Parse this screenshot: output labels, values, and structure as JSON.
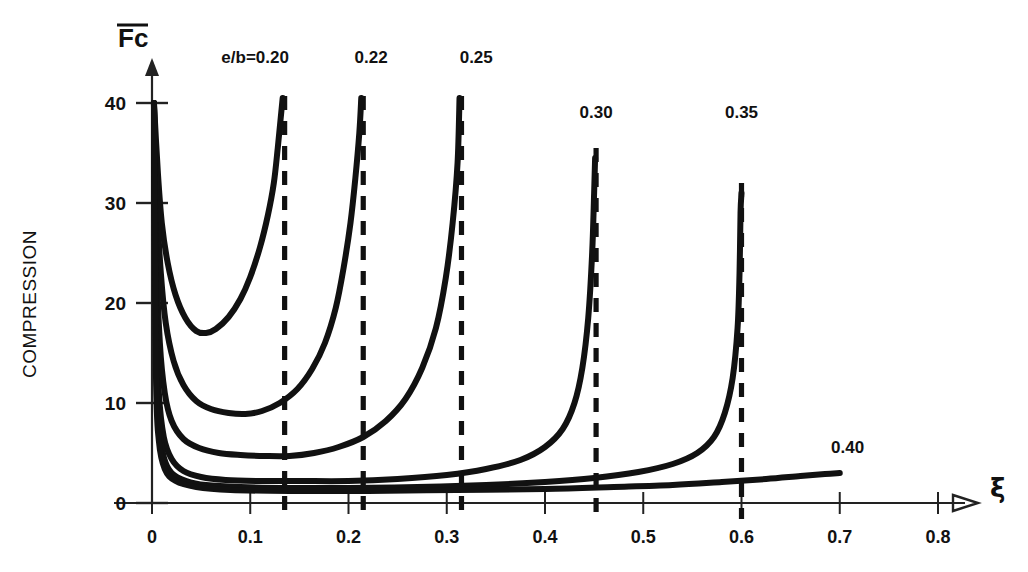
{
  "chart_data": {
    "type": "line",
    "title": "",
    "xlabel": "ξ",
    "ylabel": "Fc",
    "ylabel_full": "COMPRESSION",
    "ylabel_axis_symbol": "F̄c",
    "xlim": [
      0,
      0.8
    ],
    "ylim": [
      0,
      42
    ],
    "xticks": [
      0,
      0.1,
      0.2,
      0.3,
      0.4,
      0.5,
      0.6,
      0.7,
      0.8
    ],
    "xticklabels": [
      "0",
      "0.1",
      "0.2",
      "0.3",
      "0.4",
      "0.5",
      "0.6",
      "0.7",
      "0.8"
    ],
    "yticks": [
      0,
      10,
      20,
      30,
      40
    ],
    "yticklabels": [
      "0",
      "10",
      "20",
      "30",
      "40"
    ],
    "grid": false,
    "legend_position": "inline-curve-labels",
    "legend_prefix": "e/b=",
    "series": [
      {
        "name": "e/b=0.20",
        "label": "e/b=0.20",
        "asymptote_x": 0.135,
        "minimum": {
          "x": 0.05,
          "y": 17.0
        },
        "points": [
          {
            "x": 0.002,
            "y": 40.0
          },
          {
            "x": 0.006,
            "y": 33.0
          },
          {
            "x": 0.01,
            "y": 28.0
          },
          {
            "x": 0.016,
            "y": 24.0
          },
          {
            "x": 0.024,
            "y": 20.8
          },
          {
            "x": 0.034,
            "y": 18.5
          },
          {
            "x": 0.045,
            "y": 17.2
          },
          {
            "x": 0.055,
            "y": 17.0
          },
          {
            "x": 0.065,
            "y": 17.4
          },
          {
            "x": 0.078,
            "y": 18.6
          },
          {
            "x": 0.09,
            "y": 20.4
          },
          {
            "x": 0.1,
            "y": 22.6
          },
          {
            "x": 0.11,
            "y": 25.6
          },
          {
            "x": 0.118,
            "y": 28.8
          },
          {
            "x": 0.124,
            "y": 32.0
          },
          {
            "x": 0.128,
            "y": 35.5
          },
          {
            "x": 0.131,
            "y": 38.5
          },
          {
            "x": 0.133,
            "y": 40.5
          }
        ]
      },
      {
        "name": "e/b=0.22",
        "label": "0.22",
        "asymptote_x": 0.215,
        "minimum": {
          "x": 0.095,
          "y": 8.9
        },
        "points": [
          {
            "x": 0.002,
            "y": 40.0
          },
          {
            "x": 0.005,
            "y": 30.0
          },
          {
            "x": 0.009,
            "y": 23.0
          },
          {
            "x": 0.014,
            "y": 18.0
          },
          {
            "x": 0.022,
            "y": 14.2
          },
          {
            "x": 0.032,
            "y": 11.8
          },
          {
            "x": 0.045,
            "y": 10.2
          },
          {
            "x": 0.06,
            "y": 9.4
          },
          {
            "x": 0.078,
            "y": 9.0
          },
          {
            "x": 0.095,
            "y": 8.9
          },
          {
            "x": 0.112,
            "y": 9.2
          },
          {
            "x": 0.13,
            "y": 10.0
          },
          {
            "x": 0.148,
            "y": 11.4
          },
          {
            "x": 0.163,
            "y": 13.4
          },
          {
            "x": 0.176,
            "y": 16.0
          },
          {
            "x": 0.187,
            "y": 19.5
          },
          {
            "x": 0.195,
            "y": 23.5
          },
          {
            "x": 0.202,
            "y": 28.0
          },
          {
            "x": 0.207,
            "y": 32.5
          },
          {
            "x": 0.211,
            "y": 37.0
          },
          {
            "x": 0.213,
            "y": 40.5
          }
        ]
      },
      {
        "name": "e/b=0.25",
        "label": "0.25",
        "asymptote_x": 0.315,
        "minimum": {
          "x": 0.135,
          "y": 4.7
        },
        "points": [
          {
            "x": 0.002,
            "y": 40.0
          },
          {
            "x": 0.004,
            "y": 26.0
          },
          {
            "x": 0.008,
            "y": 16.0
          },
          {
            "x": 0.013,
            "y": 11.0
          },
          {
            "x": 0.02,
            "y": 8.2
          },
          {
            "x": 0.032,
            "y": 6.4
          },
          {
            "x": 0.048,
            "y": 5.5
          },
          {
            "x": 0.068,
            "y": 5.0
          },
          {
            "x": 0.09,
            "y": 4.8
          },
          {
            "x": 0.115,
            "y": 4.7
          },
          {
            "x": 0.14,
            "y": 4.7
          },
          {
            "x": 0.165,
            "y": 5.0
          },
          {
            "x": 0.19,
            "y": 5.6
          },
          {
            "x": 0.215,
            "y": 6.6
          },
          {
            "x": 0.238,
            "y": 8.2
          },
          {
            "x": 0.258,
            "y": 10.4
          },
          {
            "x": 0.275,
            "y": 13.5
          },
          {
            "x": 0.289,
            "y": 17.5
          },
          {
            "x": 0.299,
            "y": 22.5
          },
          {
            "x": 0.306,
            "y": 28.0
          },
          {
            "x": 0.311,
            "y": 34.0
          },
          {
            "x": 0.313,
            "y": 40.5
          }
        ]
      },
      {
        "name": "e/b=0.30",
        "label": "0.30",
        "asymptote_x": 0.452,
        "minimum": {
          "x": 0.2,
          "y": 2.2
        },
        "points": [
          {
            "x": 0.002,
            "y": 40.0
          },
          {
            "x": 0.004,
            "y": 20.0
          },
          {
            "x": 0.007,
            "y": 11.0
          },
          {
            "x": 0.012,
            "y": 6.6
          },
          {
            "x": 0.02,
            "y": 4.4
          },
          {
            "x": 0.032,
            "y": 3.2
          },
          {
            "x": 0.05,
            "y": 2.6
          },
          {
            "x": 0.075,
            "y": 2.3
          },
          {
            "x": 0.11,
            "y": 2.2
          },
          {
            "x": 0.15,
            "y": 2.2
          },
          {
            "x": 0.2,
            "y": 2.2
          },
          {
            "x": 0.25,
            "y": 2.4
          },
          {
            "x": 0.3,
            "y": 2.8
          },
          {
            "x": 0.34,
            "y": 3.4
          },
          {
            "x": 0.375,
            "y": 4.3
          },
          {
            "x": 0.4,
            "y": 5.6
          },
          {
            "x": 0.418,
            "y": 7.4
          },
          {
            "x": 0.43,
            "y": 10.0
          },
          {
            "x": 0.438,
            "y": 13.5
          },
          {
            "x": 0.444,
            "y": 18.5
          },
          {
            "x": 0.448,
            "y": 25.0
          },
          {
            "x": 0.45,
            "y": 31.0
          },
          {
            "x": 0.451,
            "y": 34.5
          }
        ]
      },
      {
        "name": "e/b=0.35",
        "label": "0.35",
        "asymptote_x": 0.6,
        "minimum": {
          "x": 0.25,
          "y": 1.5
        },
        "points": [
          {
            "x": 0.002,
            "y": 40.0
          },
          {
            "x": 0.004,
            "y": 16.0
          },
          {
            "x": 0.007,
            "y": 8.0
          },
          {
            "x": 0.012,
            "y": 4.6
          },
          {
            "x": 0.02,
            "y": 3.0
          },
          {
            "x": 0.035,
            "y": 2.2
          },
          {
            "x": 0.055,
            "y": 1.8
          },
          {
            "x": 0.09,
            "y": 1.6
          },
          {
            "x": 0.14,
            "y": 1.5
          },
          {
            "x": 0.2,
            "y": 1.5
          },
          {
            "x": 0.27,
            "y": 1.6
          },
          {
            "x": 0.34,
            "y": 1.8
          },
          {
            "x": 0.4,
            "y": 2.1
          },
          {
            "x": 0.45,
            "y": 2.5
          },
          {
            "x": 0.495,
            "y": 3.1
          },
          {
            "x": 0.53,
            "y": 3.9
          },
          {
            "x": 0.555,
            "y": 5.0
          },
          {
            "x": 0.572,
            "y": 6.6
          },
          {
            "x": 0.583,
            "y": 9.0
          },
          {
            "x": 0.591,
            "y": 12.5
          },
          {
            "x": 0.596,
            "y": 17.5
          },
          {
            "x": 0.598,
            "y": 23.0
          },
          {
            "x": 0.599,
            "y": 29.0
          },
          {
            "x": 0.6,
            "y": 31.0
          }
        ]
      },
      {
        "name": "e/b=0.40",
        "label": "0.40",
        "asymptote_x": null,
        "minimum": {
          "x": 0.3,
          "y": 1.2
        },
        "points": [
          {
            "x": 0.002,
            "y": 40.0
          },
          {
            "x": 0.004,
            "y": 13.0
          },
          {
            "x": 0.007,
            "y": 6.2
          },
          {
            "x": 0.013,
            "y": 3.4
          },
          {
            "x": 0.024,
            "y": 2.2
          },
          {
            "x": 0.045,
            "y": 1.6
          },
          {
            "x": 0.08,
            "y": 1.3
          },
          {
            "x": 0.14,
            "y": 1.2
          },
          {
            "x": 0.22,
            "y": 1.2
          },
          {
            "x": 0.31,
            "y": 1.3
          },
          {
            "x": 0.4,
            "y": 1.4
          },
          {
            "x": 0.47,
            "y": 1.6
          },
          {
            "x": 0.53,
            "y": 1.8
          },
          {
            "x": 0.58,
            "y": 2.1
          },
          {
            "x": 0.625,
            "y": 2.4
          },
          {
            "x": 0.66,
            "y": 2.7
          },
          {
            "x": 0.685,
            "y": 2.9
          },
          {
            "x": 0.7,
            "y": 3.0
          }
        ]
      }
    ],
    "asymptotes": [
      {
        "series": "e/b=0.20",
        "x": 0.135,
        "style": "dashed",
        "y_top": 40.0
      },
      {
        "series": "e/b=0.22",
        "x": 0.215,
        "style": "dashed",
        "y_top": 40.0
      },
      {
        "series": "e/b=0.25",
        "x": 0.315,
        "style": "dashed",
        "y_top": 40.0
      },
      {
        "series": "e/b=0.30",
        "x": 0.452,
        "style": "dashed",
        "y_top": 34.5
      },
      {
        "series": "e/b=0.35",
        "x": 0.6,
        "style": "dashed",
        "y_top": 31.0
      }
    ],
    "annotations": [
      {
        "text": "e/b=0.20",
        "x": 0.105,
        "y": 44.0
      },
      {
        "text": "0.22",
        "x": 0.223,
        "y": 44.0
      },
      {
        "text": "0.25",
        "x": 0.33,
        "y": 44.0
      },
      {
        "text": "0.30",
        "x": 0.452,
        "y": 38.5
      },
      {
        "text": "0.35",
        "x": 0.6,
        "y": 38.5
      },
      {
        "text": "0.40",
        "x": 0.708,
        "y": 5.0
      }
    ],
    "colors": {
      "curve": "#111111",
      "axis": "#222222",
      "asymptote": "#111111",
      "background": "#ffffff",
      "text": "#111111"
    }
  }
}
